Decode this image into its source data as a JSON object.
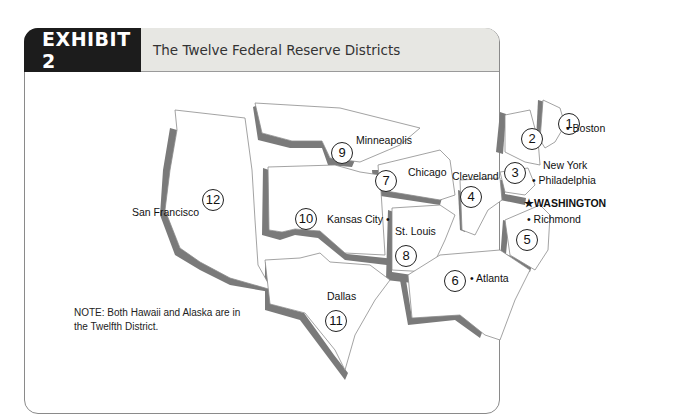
{
  "exhibit": {
    "label": "EXHIBIT 2",
    "title": "The Twelve Federal Reserve Districts"
  },
  "districts": [
    {
      "number": "1",
      "city": "Boston"
    },
    {
      "number": "2",
      "city": "New York"
    },
    {
      "number": "3",
      "city": "Philadelphia"
    },
    {
      "number": "4",
      "city": "Cleveland"
    },
    {
      "number": "5",
      "city": "Richmond"
    },
    {
      "number": "6",
      "city": "Atlanta"
    },
    {
      "number": "7",
      "city": "Chicago"
    },
    {
      "number": "8",
      "city": "St. Louis"
    },
    {
      "number": "9",
      "city": "Minneapolis"
    },
    {
      "number": "10",
      "city": "Kansas City"
    },
    {
      "number": "11",
      "city": "Dallas"
    },
    {
      "number": "12",
      "city": "San Francisco"
    }
  ],
  "capital": {
    "label": "WASHINGTON",
    "icon": "star-icon"
  },
  "note": "NOTE: Both Hawaii and Alaska are in the Twelfth District.",
  "colors": {
    "header_dark": "#1c1c1c",
    "header_light": "#e7e7e3",
    "shadow": "#7a7a7a",
    "border": "#8a8a8a"
  }
}
